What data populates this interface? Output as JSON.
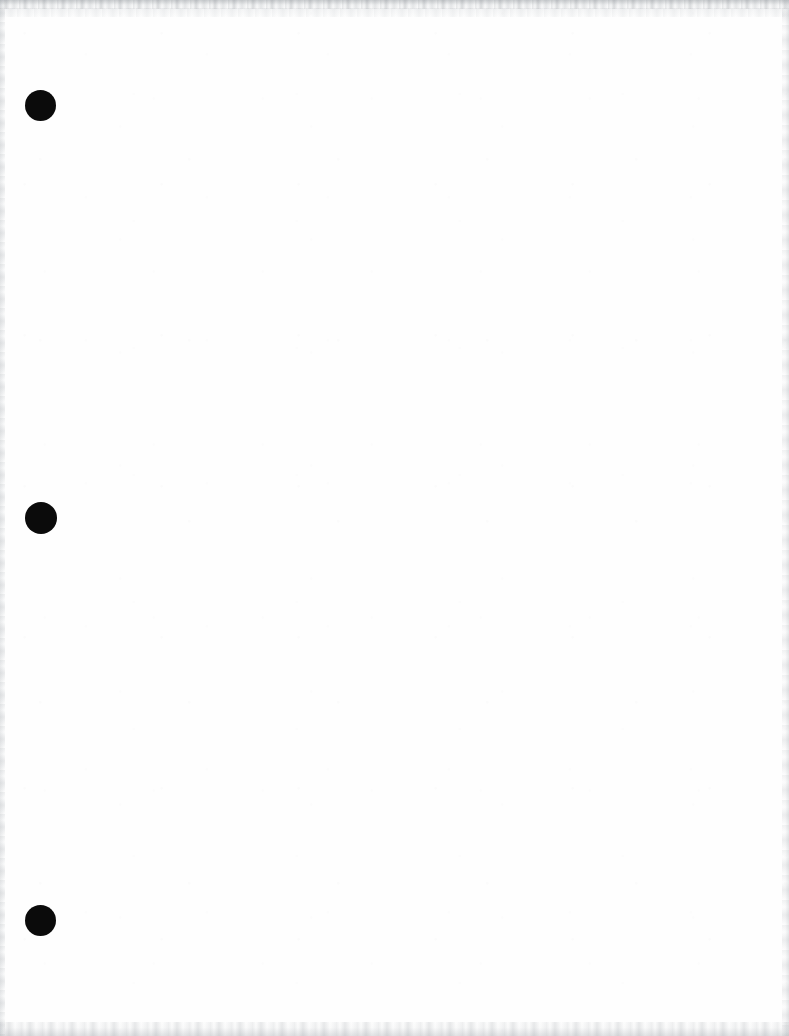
{
  "document": {
    "title": "Scanned blank page",
    "page_width": 789,
    "page_height": 1036,
    "paper_color": "#fefefe",
    "content_text": "",
    "body_note": ""
  },
  "artifacts": {
    "punch_color": "#0b0b0b",
    "edge_noise_color": "#9aa0a6",
    "holes": [
      {
        "name": "top-hole",
        "cx": 40,
        "cy": 105,
        "d": 31
      },
      {
        "name": "middle-hole",
        "cx": 41,
        "cy": 518,
        "d": 32
      },
      {
        "name": "bottom-hole",
        "cx": 40,
        "cy": 920,
        "d": 31
      }
    ]
  }
}
